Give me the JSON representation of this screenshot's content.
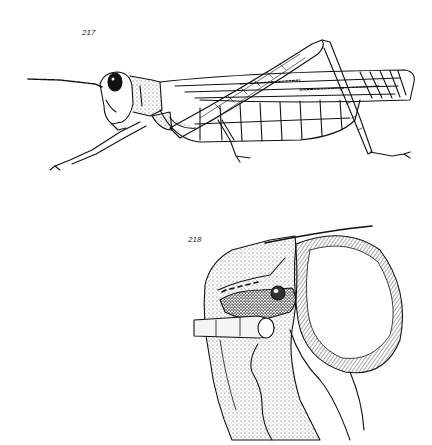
{
  "figures": [
    {
      "number": "217",
      "subject": "grasshopper-lateral-view"
    },
    {
      "number": "218",
      "subject": "grasshopper-head-detail-with-probe"
    }
  ],
  "colors": {
    "ink": "#111111",
    "paper": "#ffffff"
  }
}
